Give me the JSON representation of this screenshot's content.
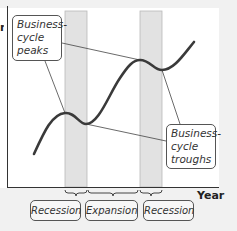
{
  "diagram": {
    "callouts": {
      "peaks": "Business-cycle peaks",
      "peaks_lines": [
        "Business-",
        "cycle",
        "peaks"
      ],
      "troughs": "Business-cycle troughs",
      "troughs_lines": [
        "Business-",
        "cycle",
        "troughs"
      ]
    },
    "x_axis_label": "Year",
    "y_axis_label_fragment": "n",
    "phases": [
      {
        "label": "Recession"
      },
      {
        "label": "Expansion"
      },
      {
        "label": "Recession"
      }
    ],
    "colors": {
      "curve": "#3a3a3a",
      "band": "#e2e2e2",
      "band_border": "#b9b9b9",
      "axis": "#333333",
      "leader": "#444444",
      "background": "#f1f1f1"
    }
  }
}
